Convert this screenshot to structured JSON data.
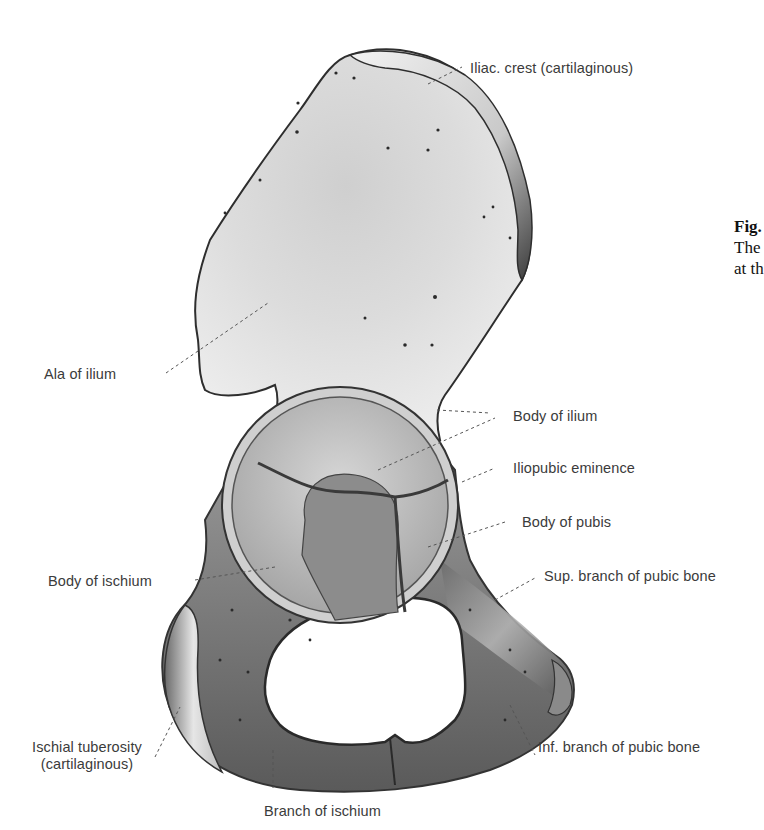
{
  "figure": {
    "caption_visible": {
      "line1": "Fig.",
      "line2": "The",
      "line3": "at th"
    },
    "colors": {
      "background": "#ffffff",
      "bone_light": "#e4e4e4",
      "bone_mid": "#b8b8b8",
      "bone_dark": "#4a4a4a",
      "label_text": "#3b3b3b",
      "leader_line": "#555555"
    }
  },
  "labels": [
    {
      "id": "iliac-crest",
      "text": "Iliac. crest (cartilaginous)"
    },
    {
      "id": "ala-of-ilium",
      "text": "Ala of ilium"
    },
    {
      "id": "body-of-ilium",
      "text": "Body of ilium"
    },
    {
      "id": "iliopubic-eminence",
      "text": "Iliopubic eminence"
    },
    {
      "id": "body-of-pubis",
      "text": "Body of pubis"
    },
    {
      "id": "body-of-ischium",
      "text": "Body of ischium"
    },
    {
      "id": "sup-branch-pubic-bone",
      "text": "Sup. branch of pubic bone"
    },
    {
      "id": "ischial-tuberosity",
      "text": "Ischial tuberosity",
      "text2": "(cartilaginous)"
    },
    {
      "id": "inf-branch-pubic-bone",
      "text": "Inf. branch of pubic bone"
    },
    {
      "id": "branch-of-ischium",
      "text": "Branch of ischium"
    }
  ]
}
